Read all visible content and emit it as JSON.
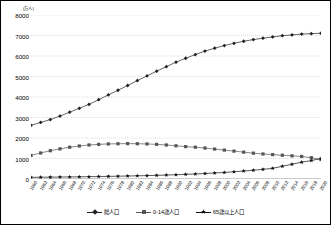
{
  "chart_data": {
    "type": "line",
    "title": "",
    "subtitle": "",
    "unit_label": "(万人)",
    "xlabel": "",
    "ylabel": "",
    "ylim": [
      0,
      8000
    ],
    "ytick_step": 1000,
    "yticks": [
      "0",
      "1000",
      "2000",
      "3000",
      "4000",
      "5000",
      "6000",
      "7000",
      "8000"
    ],
    "grid": true,
    "grid_style": "dotted-horizontal",
    "legend_position": "bottom",
    "categories": [
      "1960",
      "1962",
      "1964",
      "1966",
      "1968",
      "1970",
      "1972",
      "1974",
      "1976",
      "1978",
      "1980",
      "1982",
      "1984",
      "1986",
      "1988",
      "1990",
      "1992",
      "1994",
      "1996",
      "1998",
      "2000",
      "2002",
      "2004",
      "2006",
      "2008",
      "2010",
      "2012",
      "2014",
      "2016",
      "2018",
      "2020"
    ],
    "series": [
      {
        "name": "総人口",
        "marker": "diamond",
        "color": "#222222",
        "values": [
          2620,
          2760,
          2900,
          3070,
          3260,
          3450,
          3640,
          3870,
          4100,
          4330,
          4560,
          4800,
          5030,
          5260,
          5480,
          5700,
          5890,
          6070,
          6240,
          6380,
          6510,
          6620,
          6720,
          6800,
          6870,
          6930,
          6990,
          7030,
          7070,
          7090,
          7110
        ]
      },
      {
        "name": "0-14歳人口",
        "marker": "square",
        "color": "#555555",
        "values": [
          1150,
          1270,
          1380,
          1470,
          1550,
          1610,
          1660,
          1690,
          1710,
          1720,
          1725,
          1720,
          1710,
          1690,
          1660,
          1620,
          1580,
          1550,
          1510,
          1460,
          1410,
          1360,
          1310,
          1260,
          1220,
          1190,
          1160,
          1130,
          1100,
          1040,
          950
        ]
      },
      {
        "name": "65歳以上人口",
        "marker": "star",
        "color": "#111111",
        "values": [
          80,
          85,
          90,
          95,
          100,
          105,
          112,
          120,
          128,
          136,
          145,
          155,
          166,
          178,
          192,
          208,
          226,
          246,
          268,
          292,
          320,
          352,
          388,
          428,
          470,
          520,
          620,
          720,
          820,
          900,
          1000
        ]
      }
    ]
  }
}
